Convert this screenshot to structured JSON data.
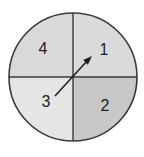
{
  "figure": {
    "type": "spinner-diagram",
    "sections": [
      {
        "label": "4",
        "position": "top-left",
        "fill": "#d9d9d9"
      },
      {
        "label": "1",
        "position": "top-right",
        "fill": "#dadada"
      },
      {
        "label": "2",
        "position": "bottom-right",
        "fill": "#c8c8c8"
      },
      {
        "label": "3",
        "position": "bottom-left",
        "fill": "#e5e5e5"
      }
    ],
    "arrow": {
      "points_to": "1",
      "direction": "up-right",
      "color": "#1c1c1c"
    },
    "stroke_color": "#3a3a3a",
    "background": "#ffffff"
  }
}
